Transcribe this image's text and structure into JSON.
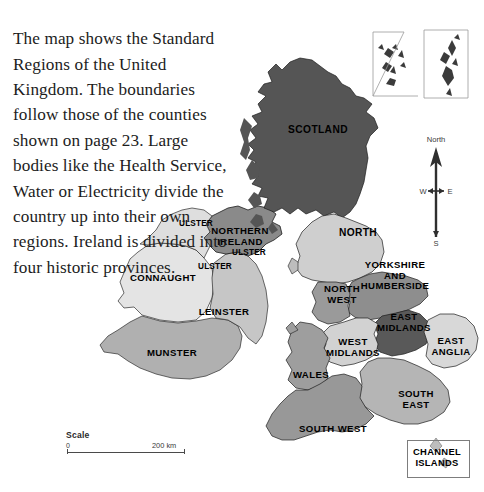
{
  "caption": {
    "text": "The map shows the Standard Regions of the United Kingdom. The boundaries follow those of the counties shown on page 23. Large bodies like the Health Service, Water or Electricity divide the country up into their own regions. Ireland is divided into four historic provinces."
  },
  "map": {
    "title": "Standard Regions of the United Kingdom",
    "regions": [
      {
        "id": "scotland",
        "label": "SCOTLAND",
        "x": 318,
        "y": 130,
        "tone": "#555555",
        "country": "Scotland"
      },
      {
        "id": "north",
        "label": "NORTH",
        "x": 358,
        "y": 233,
        "tone": "#cfcfcf",
        "country": "England"
      },
      {
        "id": "yorkshire",
        "label": "YORKSHIRE\nAND\nHUMBERSIDE",
        "x": 395,
        "y": 276,
        "tone": "#8e8e8e",
        "country": "England"
      },
      {
        "id": "north-west",
        "label": "NORTH\nWEST",
        "x": 342,
        "y": 294,
        "tone": "#9a9a9a",
        "country": "England"
      },
      {
        "id": "east-midlands",
        "label": "EAST\nMIDLANDS",
        "x": 404,
        "y": 322,
        "tone": "#595959",
        "country": "England"
      },
      {
        "id": "west-midlands",
        "label": "WEST\nMIDLANDS",
        "x": 353,
        "y": 347,
        "tone": "#d2d2d2",
        "country": "England"
      },
      {
        "id": "east-anglia",
        "label": "EAST\nANGLIA",
        "x": 451,
        "y": 346,
        "tone": "#d8d8d8",
        "country": "England"
      },
      {
        "id": "wales",
        "label": "WALES",
        "x": 311,
        "y": 375,
        "tone": "#9e9e9e",
        "country": "Wales"
      },
      {
        "id": "south-east",
        "label": "SOUTH\nEAST",
        "x": 416,
        "y": 399,
        "tone": "#b5b5b5",
        "country": "England"
      },
      {
        "id": "south-west",
        "label": "SOUTH WEST",
        "x": 333,
        "y": 429,
        "tone": "#989898",
        "country": "England"
      },
      {
        "id": "northern-ireland",
        "label": "NORTHERN\nIRELAND",
        "x": 240,
        "y": 236,
        "tone": "#8a8a8a",
        "country": "Northern Ireland"
      },
      {
        "id": "connaught",
        "label": "CONNAUGHT",
        "x": 163,
        "y": 278,
        "tone": "#e4e4e4",
        "country": "Ireland"
      },
      {
        "id": "leinster",
        "label": "LEINSTER",
        "x": 224,
        "y": 312,
        "tone": "#c6c6c6",
        "country": "Ireland"
      },
      {
        "id": "munster",
        "label": "MUNSTER",
        "x": 172,
        "y": 353,
        "tone": "#b0b0b0",
        "country": "Ireland"
      }
    ],
    "extra_labels": [
      {
        "id": "ulster-1",
        "label": "ULSTER",
        "x": 196,
        "y": 224
      },
      {
        "id": "ulster-2",
        "label": "ULSTER",
        "x": 249,
        "y": 253
      },
      {
        "id": "ulster-3",
        "label": "ULSTER",
        "x": 215,
        "y": 267
      }
    ],
    "compass": {
      "north": "North",
      "south": "S",
      "west": "W",
      "east": "E"
    },
    "scale": {
      "title": "Scale",
      "min": "0",
      "max": "200 km"
    },
    "insets": [
      {
        "id": "orkney",
        "label": ""
      },
      {
        "id": "shetland",
        "label": ""
      },
      {
        "id": "channel-islands",
        "label": "CHANNEL\nISLANDS"
      }
    ]
  }
}
